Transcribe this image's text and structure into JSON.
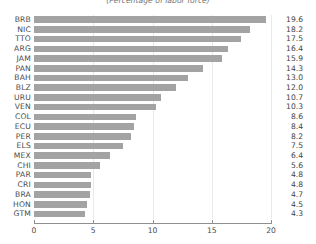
{
  "chart_data": {
    "type": "bar",
    "orientation": "horizontal",
    "title": "",
    "subtitle": "(Percentage of labor force)",
    "xlabel": "",
    "ylabel": "",
    "xlim": [
      0,
      20
    ],
    "xticks": [
      0,
      5,
      10,
      15,
      20
    ],
    "grid": true,
    "legend": false,
    "bar_color": "#a3a3a3",
    "gridline_color": "#e9e9e9",
    "axis_color": "#8f8f8f",
    "label_color": "#4a4a4a",
    "value_labels_shown": true,
    "categories": [
      "BRB",
      "NIC",
      "TTO",
      "ARG",
      "JAM",
      "PAN",
      "BAH",
      "BLZ",
      "URU",
      "VEN",
      "COL",
      "ECU",
      "PER",
      "ELS",
      "MEX",
      "CHI",
      "PAR",
      "CRI",
      "BRA",
      "HON",
      "GTM"
    ],
    "values": [
      19.6,
      18.2,
      17.5,
      16.4,
      15.9,
      14.3,
      13.0,
      12.0,
      10.7,
      10.3,
      8.6,
      8.4,
      8.2,
      7.5,
      6.4,
      5.6,
      4.8,
      4.8,
      4.7,
      4.5,
      4.3
    ],
    "value_label_text": [
      "19.6",
      "18.2",
      "17.5",
      "16.4",
      "15.9",
      "14.3",
      "13.0",
      "12.0",
      "10.7",
      "10.3",
      "8.6",
      "8.4",
      "8.2",
      "7.5",
      "6.4",
      "5.6",
      "4.8",
      "4.8",
      "4.7",
      "4.5",
      "4.3"
    ],
    "xtick_labels": [
      "0",
      "5",
      "10",
      "15",
      "20"
    ]
  }
}
